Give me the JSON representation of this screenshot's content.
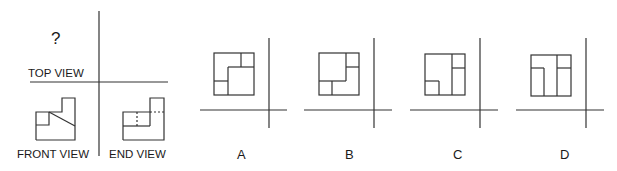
{
  "question": {
    "unknown_marker": "?",
    "top_view_label": "TOP VIEW",
    "front_view_label": "FRONT VIEW",
    "end_view_label": "END VIEW"
  },
  "options": [
    {
      "label": "A"
    },
    {
      "label": "B"
    },
    {
      "label": "C"
    },
    {
      "label": "D"
    }
  ],
  "colors": {
    "line": "#333333",
    "text": "#1a1a1a",
    "background": "#ffffff"
  }
}
